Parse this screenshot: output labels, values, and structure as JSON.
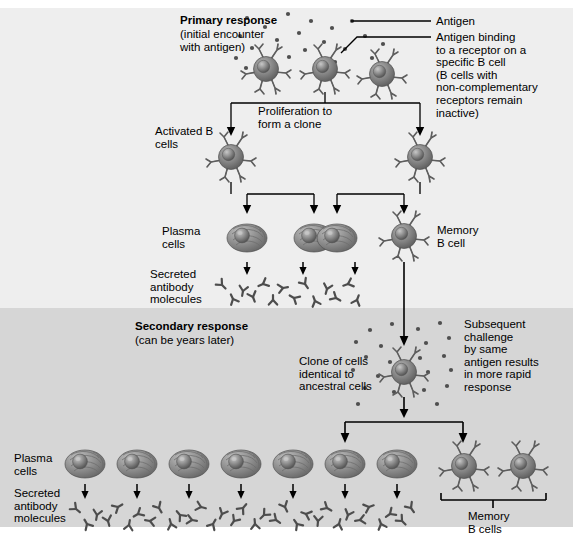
{
  "diagram": {
    "title_primary": "Primary response",
    "subtitle_primary": "(initial encounter\nwith antigen)",
    "title_secondary": "Secondary response",
    "subtitle_secondary": "(can be years later)",
    "bg_primary": "#eeeeee",
    "bg_secondary": "#d6d6d6",
    "cell_color": "#7a7a7a",
    "cell_dark": "#4a4a4a",
    "antigen_color": "#555555",
    "line_color": "#000000"
  },
  "labels": {
    "antigen": "Antigen",
    "antigen_binding": "Antigen binding\nto a receptor on a\nspecific B cell\n(B cells with\nnon-complementary\nreceptors remain\ninactive)",
    "proliferation": "Proliferation to\nform a clone",
    "activated_b_cells": "Activated B\ncells",
    "plasma_cells_top": "Plasma\ncells",
    "secreted_antibody_top": "Secreted\nantibody\nmolecules",
    "memory_b_cell": "Memory\nB cell",
    "clone_of_cells": "Clone of cells\nidentical to\nancestral cells",
    "subsequent_challenge": "Subsequent\nchallenge\nby same\nantigen results\nin more rapid\nresponse",
    "plasma_cells_bottom": "Plasma\ncells",
    "secreted_antibody_bottom": "Secreted\nantibody\nmolecules",
    "memory_b_cells_bottom": "Memory\nB cells"
  },
  "counts": {
    "top_b_cells": 3,
    "activated_b_cells": 2,
    "plasma_cells_top": 3,
    "memory_b_cell_top": 1,
    "plasma_cells_bottom": 7,
    "memory_b_cells_bottom": 2
  }
}
